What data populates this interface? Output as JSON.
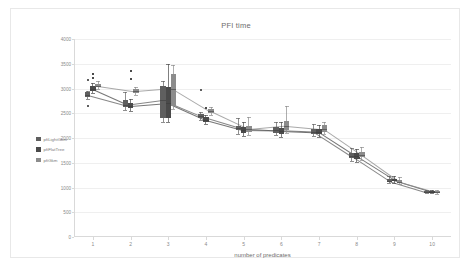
{
  "frame": {
    "border_color": "#e8e8e8"
  },
  "chart_data": {
    "type": "bar",
    "title": "PFI time",
    "xlabel": "number of predicates",
    "ylabel": "",
    "categories": [
      "1",
      "2",
      "3",
      "4",
      "5",
      "6",
      "7",
      "8",
      "9",
      "10"
    ],
    "x": [
      1,
      2,
      3,
      4,
      5,
      6,
      7,
      8,
      9,
      10
    ],
    "ylim": [
      0,
      4000
    ],
    "yticks": [
      0,
      500,
      1000,
      1500,
      2000,
      2500,
      3000,
      3500,
      4000
    ],
    "ytick_labels": [
      "0",
      "500",
      "1000",
      "1500",
      "2000",
      "2500",
      "3000",
      "3500",
      "4000"
    ],
    "xticks": [
      1,
      2,
      3,
      4,
      5,
      6,
      7,
      8,
      9,
      10
    ],
    "grid": true,
    "legend_position": "left",
    "colors": {
      "pfiLightGkm": "#5f5f5f",
      "pfiFlatTree": "#4a4a4a",
      "pfiGkm": "#8c8c8c"
    },
    "series": [
      {
        "name": "pfiLightGkm",
        "color": "#5f5f5f",
        "values": [
          2870,
          2660,
          2760,
          2440,
          2210,
          2160,
          2130,
          1640,
          1140,
          910
        ],
        "boxes": [
          {
            "x": 1,
            "low": 2790,
            "q1": 2820,
            "median": 2870,
            "q3": 2920,
            "high": 2950,
            "outliers": [
              3180,
              2650
            ]
          },
          {
            "x": 2,
            "low": 2560,
            "q1": 2620,
            "median": 2660,
            "q3": 2760,
            "high": 2920,
            "outliers": []
          },
          {
            "x": 3,
            "low": 2330,
            "q1": 2410,
            "median": 2760,
            "q3": 3050,
            "high": 3150,
            "outliers": []
          },
          {
            "x": 4,
            "low": 2360,
            "q1": 2400,
            "median": 2440,
            "q3": 2480,
            "high": 2530,
            "outliers": [
              2960
            ]
          },
          {
            "x": 5,
            "low": 2090,
            "q1": 2160,
            "median": 2210,
            "q3": 2250,
            "high": 2400,
            "outliers": []
          },
          {
            "x": 6,
            "low": 2060,
            "q1": 2110,
            "median": 2160,
            "q3": 2220,
            "high": 2330,
            "outliers": []
          },
          {
            "x": 7,
            "low": 2040,
            "q1": 2090,
            "median": 2130,
            "q3": 2180,
            "high": 2290,
            "outliers": []
          },
          {
            "x": 8,
            "low": 1540,
            "q1": 1590,
            "median": 1640,
            "q3": 1700,
            "high": 1790,
            "outliers": []
          },
          {
            "x": 9,
            "low": 1090,
            "q1": 1120,
            "median": 1140,
            "q3": 1170,
            "high": 1230,
            "outliers": []
          },
          {
            "x": 10,
            "low": 880,
            "q1": 895,
            "median": 910,
            "q3": 925,
            "high": 950,
            "outliers": []
          }
        ]
      },
      {
        "name": "pfiFlatTree",
        "color": "#4a4a4a",
        "values": [
          2990,
          2650,
          2710,
          2370,
          2160,
          2150,
          2120,
          1630,
          1150,
          915
        ],
        "boxes": [
          {
            "x": 1,
            "low": 2900,
            "q1": 2940,
            "median": 2990,
            "q3": 3060,
            "high": 3120,
            "outliers": [
              3300,
              3220
            ]
          },
          {
            "x": 2,
            "low": 2540,
            "q1": 2600,
            "median": 2650,
            "q3": 2700,
            "high": 2790,
            "outliers": [
              3360,
              3190
            ]
          },
          {
            "x": 3,
            "low": 2320,
            "q1": 2400,
            "median": 2710,
            "q3": 3030,
            "high": 3500,
            "outliers": []
          },
          {
            "x": 4,
            "low": 2280,
            "q1": 2330,
            "median": 2370,
            "q3": 2420,
            "high": 2470,
            "outliers": [
              2600
            ]
          },
          {
            "x": 5,
            "low": 2040,
            "q1": 2110,
            "median": 2160,
            "q3": 2220,
            "high": 2320,
            "outliers": []
          },
          {
            "x": 6,
            "low": 2030,
            "q1": 2090,
            "median": 2150,
            "q3": 2210,
            "high": 2320,
            "outliers": []
          },
          {
            "x": 7,
            "low": 2030,
            "q1": 2080,
            "median": 2120,
            "q3": 2180,
            "high": 2270,
            "outliers": []
          },
          {
            "x": 8,
            "low": 1520,
            "q1": 1580,
            "median": 1630,
            "q3": 1690,
            "high": 1780,
            "outliers": []
          },
          {
            "x": 9,
            "low": 1100,
            "q1": 1130,
            "median": 1150,
            "q3": 1180,
            "high": 1240,
            "outliers": []
          },
          {
            "x": 10,
            "low": 885,
            "q1": 900,
            "median": 915,
            "q3": 930,
            "high": 955,
            "outliers": []
          }
        ]
      },
      {
        "name": "pfiGkm",
        "color": "#8c8c8c",
        "values": [
          3050,
          2940,
          3000,
          2540,
          2180,
          2250,
          2180,
          1660,
          1120,
          905
        ],
        "boxes": [
          {
            "x": 1,
            "low": 2980,
            "q1": 3020,
            "median": 3050,
            "q3": 3090,
            "high": 3150,
            "outliers": []
          },
          {
            "x": 2,
            "low": 2870,
            "q1": 2910,
            "median": 2940,
            "q3": 2980,
            "high": 3030,
            "outliers": []
          },
          {
            "x": 3,
            "low": 2590,
            "q1": 2640,
            "median": 3000,
            "q3": 3290,
            "high": 3480,
            "outliers": []
          },
          {
            "x": 4,
            "low": 2470,
            "q1": 2510,
            "median": 2540,
            "q3": 2580,
            "high": 2620,
            "outliers": []
          },
          {
            "x": 5,
            "low": 2070,
            "q1": 2130,
            "median": 2180,
            "q3": 2240,
            "high": 2420,
            "outliers": []
          },
          {
            "x": 6,
            "low": 2100,
            "q1": 2170,
            "median": 2250,
            "q3": 2350,
            "high": 2640,
            "outliers": []
          },
          {
            "x": 7,
            "low": 2080,
            "q1": 2130,
            "median": 2180,
            "q3": 2260,
            "high": 2330,
            "outliers": []
          },
          {
            "x": 8,
            "low": 1560,
            "q1": 1610,
            "median": 1660,
            "q3": 1720,
            "high": 1810,
            "outliers": []
          },
          {
            "x": 9,
            "low": 1070,
            "q1": 1100,
            "median": 1120,
            "q3": 1150,
            "high": 1210,
            "outliers": []
          },
          {
            "x": 10,
            "low": 875,
            "q1": 890,
            "median": 905,
            "q3": 920,
            "high": 945,
            "outliers": []
          }
        ]
      }
    ]
  },
  "legend": {
    "items": [
      {
        "label": "pfiLightGkm",
        "color": "#5f5f5f"
      },
      {
        "label": "pfiFlatTree",
        "color": "#4a4a4a"
      },
      {
        "label": "pfiGkm",
        "color": "#8c8c8c"
      }
    ]
  }
}
